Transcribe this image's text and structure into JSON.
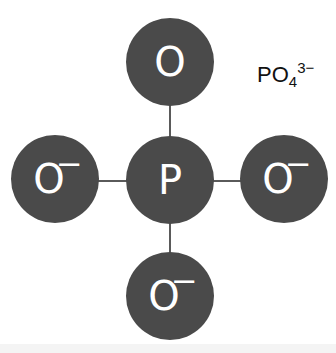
{
  "diagram": {
    "title_formula": {
      "base": "PO",
      "subscript": "4",
      "superscript": "3−"
    },
    "center_atom": {
      "symbol": "P",
      "charge": ""
    },
    "atoms": {
      "top": {
        "symbol": "O",
        "charge": ""
      },
      "left": {
        "symbol": "O",
        "charge": "−"
      },
      "right": {
        "symbol": "O",
        "charge": "−"
      },
      "bottom": {
        "symbol": "O",
        "charge": "−"
      }
    },
    "bonds": [
      "P-O(top)",
      "P-O(left)",
      "P-O(right)",
      "P-O(bottom)"
    ],
    "colors": {
      "atom_fill": "#4a4a4a",
      "atom_text": "#ffffff",
      "bond": "#5a5a5a",
      "label_text": "#111111"
    }
  }
}
